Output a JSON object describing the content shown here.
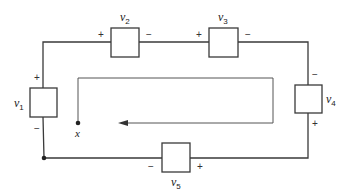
{
  "diagram": {
    "type": "circuit-loop",
    "elements": [
      {
        "id": "v1",
        "symbol": "v",
        "subscript": "1",
        "plus": "+",
        "minus": "−"
      },
      {
        "id": "v2",
        "symbol": "v",
        "subscript": "2",
        "plus": "+",
        "minus": "−"
      },
      {
        "id": "v3",
        "symbol": "v",
        "subscript": "3",
        "plus": "+",
        "minus": "−"
      },
      {
        "id": "v4",
        "symbol": "v",
        "subscript": "4",
        "plus": "+",
        "minus": "−"
      },
      {
        "id": "v5",
        "symbol": "v",
        "subscript": "5",
        "plus": "+",
        "minus": "−"
      }
    ],
    "start_point_label": "x",
    "loop_direction": "clockwise"
  },
  "colors": {
    "wire": "#3a3a3a",
    "background": "#ffffff"
  }
}
